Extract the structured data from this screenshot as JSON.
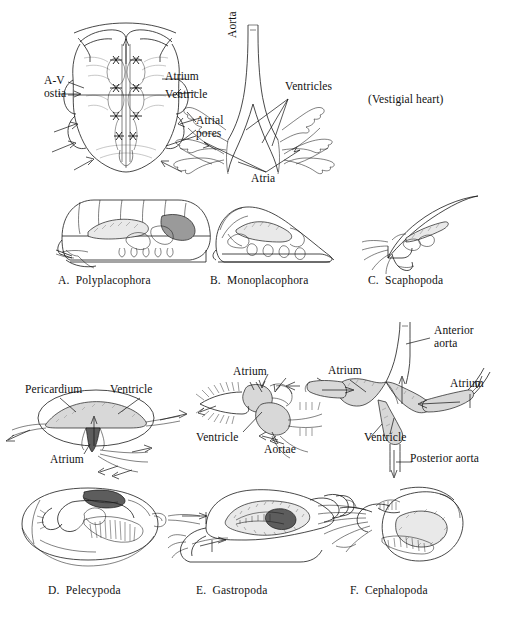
{
  "figure": {
    "title_visible": false,
    "background_color": "#ffffff",
    "ink_color": "#1a1a1a"
  },
  "top_row": {
    "polyplacophora_heart": {
      "labels": [
        {
          "key": "av_ostia",
          "text": "A-V\nostia",
          "x": 44,
          "y": 74
        },
        {
          "key": "atrium",
          "text": "Atrium",
          "x": 165,
          "y": 76
        },
        {
          "key": "ventricle",
          "text": "Ventricle",
          "x": 165,
          "y": 93
        },
        {
          "key": "atrial_pores",
          "text": "Atrial\npores",
          "x": 166,
          "y": 118
        }
      ]
    },
    "monoplacophora_heart": {
      "labels": [
        {
          "key": "aorta",
          "text": "Aorta",
          "x": 234,
          "y": 62,
          "rotated": true
        },
        {
          "key": "ventricles",
          "text": "Ventricles",
          "x": 285,
          "y": 86
        },
        {
          "key": "atria",
          "text": "Atria",
          "x": 251,
          "y": 178
        }
      ]
    },
    "scaphopoda_heart": {
      "note": {
        "key": "vestigial_heart",
        "text": "(Vestigial heart)",
        "x": 368,
        "y": 98
      }
    }
  },
  "body_row_1": {
    "captions": [
      {
        "key": "caption_a",
        "letter": "A.",
        "name": "Polyplacophora",
        "text": "A.  Polyplacophora",
        "x": 58,
        "y": 278
      },
      {
        "key": "caption_b",
        "letter": "B.",
        "name": "Monoplacophora",
        "text": "B.  Monoplacophora",
        "x": 210,
        "y": 278
      },
      {
        "key": "caption_c",
        "letter": "C.",
        "name": "Scaphopoda",
        "text": "C.  Scaphopoda",
        "x": 368,
        "y": 278
      }
    ]
  },
  "bottom_row": {
    "pelecypoda_heart": {
      "labels": [
        {
          "key": "pericardium",
          "text": "Pericardium",
          "x": 25,
          "y": 388
        },
        {
          "key": "ventricle",
          "text": "Ventricle",
          "x": 110,
          "y": 388
        },
        {
          "key": "atrium",
          "text": "Atrium",
          "x": 50,
          "y": 458
        }
      ]
    },
    "gastropoda_heart": {
      "labels": [
        {
          "key": "atrium",
          "text": "Atrium",
          "x": 233,
          "y": 371
        },
        {
          "key": "ventricle",
          "text": "Ventricle",
          "x": 203,
          "y": 437
        },
        {
          "key": "aortae",
          "text": "Aortae",
          "x": 267,
          "y": 449
        }
      ]
    },
    "cephalopoda_heart": {
      "labels": [
        {
          "key": "anterior_aorta",
          "text": "Anterior\naorta",
          "x": 434,
          "y": 330
        },
        {
          "key": "atrium_left",
          "text": "Atrium",
          "x": 334,
          "y": 370
        },
        {
          "key": "atrium_right",
          "text": "Atrium",
          "x": 456,
          "y": 383
        },
        {
          "key": "ventricle",
          "text": "Ventricle",
          "x": 368,
          "y": 437
        },
        {
          "key": "posterior_aorta",
          "text": "Posterior aorta",
          "x": 414,
          "y": 458
        }
      ]
    }
  },
  "body_row_2": {
    "captions": [
      {
        "key": "caption_d",
        "letter": "D.",
        "name": "Pelecypoda",
        "text": "D.  Pelecypoda",
        "x": 48,
        "y": 589
      },
      {
        "key": "caption_e",
        "letter": "E.",
        "name": "Gastropoda",
        "text": "E.  Gastropoda",
        "x": 196,
        "y": 589
      },
      {
        "key": "caption_f",
        "letter": "F.",
        "name": "Cephalopoda",
        "text": "F.  Cephalopoda",
        "x": 350,
        "y": 589
      }
    ]
  }
}
